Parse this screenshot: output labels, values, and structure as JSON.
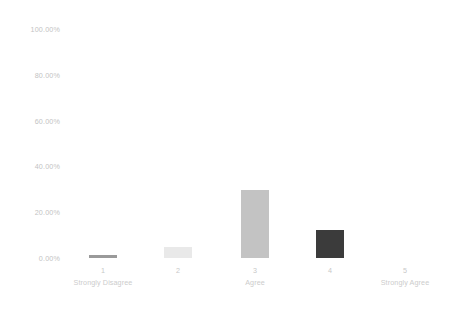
{
  "chart_data": {
    "type": "bar",
    "title": "",
    "subtitle": "",
    "xlabel": "",
    "ylabel": "",
    "grid": false,
    "legend": "none",
    "categories": [
      "1",
      "2",
      "3",
      "4",
      "5"
    ],
    "category_captions": [
      "Strongly Disagree",
      "",
      "Agree",
      "",
      "Strongly Agree"
    ],
    "values": [
      1.5,
      4.8,
      29.7,
      12.2,
      0.0
    ],
    "value_labels": [
      "1.50%",
      "4.80%",
      "29.70%",
      "12.20%",
      "0.00%"
    ],
    "ylim": [
      0,
      100
    ],
    "ytick_values": [
      100,
      80,
      60,
      40,
      20,
      0
    ],
    "ytick_labels": [
      "100.00%",
      "80.00%",
      "60.00%",
      "40.00%",
      "20.00%",
      "0.00%"
    ],
    "bar_colors": [
      "#9a9a9a",
      "#e9e9e9",
      "#c3c3c3",
      "#3b3b3b",
      "#fdfdfd"
    ],
    "series": [
      {
        "name": "Response share",
        "values": [
          1.5,
          4.8,
          29.7,
          12.2,
          0.0
        ]
      }
    ]
  },
  "axes": {
    "y_tick_label_color": "#c3c3c3",
    "x_tick_label_color": "#c8c8c8",
    "background_color": "#ffffff"
  }
}
